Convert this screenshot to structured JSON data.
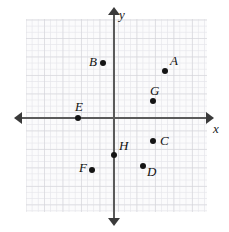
{
  "figure": {
    "type": "coordinate-plane",
    "background_color": "#ffffff",
    "grid_color": "#c8c8cd",
    "axis_color": "#5a5a5a",
    "point_color": "#141414"
  },
  "axes": {
    "x_label": "x",
    "y_label": "y",
    "origin_px": {
      "x": 114,
      "y": 118
    },
    "unit_px": 18.5,
    "x_axis_arrows": [
      "left",
      "right"
    ],
    "y_axis_arrows": [
      "up",
      "down"
    ],
    "tick_labels": []
  },
  "chart_data": {
    "type": "scatter",
    "title": "",
    "xlabel": "x",
    "ylabel": "y",
    "xlim": [
      -4.8,
      5.0
    ],
    "ylim": [
      -5.1,
      5.3
    ],
    "grid": true,
    "legend": "none",
    "points": [
      {
        "label": "A",
        "x": 2.75,
        "y": 2.55,
        "px": 165,
        "py": 71,
        "label_px": 170,
        "label_py": 54
      },
      {
        "label": "B",
        "x": -0.6,
        "y": 2.95,
        "px": 103,
        "py": 63,
        "label_px": 89,
        "label_py": 55
      },
      {
        "label": "C",
        "x": 2.1,
        "y": -1.25,
        "px": 153,
        "py": 141,
        "label_px": 160,
        "label_py": 134
      },
      {
        "label": "D",
        "x": 1.55,
        "y": -2.6,
        "px": 143,
        "py": 166,
        "label_px": 147,
        "label_py": 165
      },
      {
        "label": "E",
        "x": -1.95,
        "y": 0.0,
        "px": 78,
        "py": 118,
        "label_px": 75,
        "label_py": 100
      },
      {
        "label": "F",
        "x": -1.2,
        "y": -2.8,
        "px": 92,
        "py": 170,
        "label_px": 79,
        "label_py": 161
      },
      {
        "label": "G",
        "x": 2.1,
        "y": 0.9,
        "px": 153,
        "py": 101,
        "label_px": 150,
        "label_py": 84
      },
      {
        "label": "H",
        "x": 0.0,
        "y": -2.0,
        "px": 114,
        "py": 155,
        "label_px": 119,
        "label_py": 139
      }
    ]
  }
}
